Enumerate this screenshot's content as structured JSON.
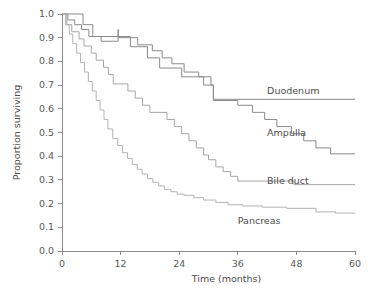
{
  "chart_data": {
    "type": "line",
    "title": "",
    "subtitle": "",
    "xlabel": "Time (months)",
    "ylabel": "Proportion surviving",
    "xlim": [
      0,
      60
    ],
    "ylim": [
      0.0,
      1.0
    ],
    "xticks": [
      0,
      12,
      24,
      36,
      48,
      60
    ],
    "xticklabels": [
      "0",
      "12",
      "24",
      "36",
      "48",
      "60"
    ],
    "yticks": [
      0.0,
      0.1,
      0.2,
      0.3,
      0.4,
      0.5,
      0.6,
      0.7,
      0.8,
      0.9,
      1.0
    ],
    "yticklabels": [
      "0.0",
      "0.1",
      "0.2",
      "0.3",
      "0.4",
      "0.5",
      "0.6",
      "0.7",
      "0.8",
      "0.9",
      "1.0"
    ],
    "grid": false,
    "legend_position": "inline-right-of-curve",
    "plot_style": "kaplan-meier step curves",
    "series": [
      {
        "name": "Duodenum",
        "color": "#8a8a8a",
        "label_x": 42.0,
        "label_y": 0.675,
        "final_value": 0.64,
        "points": [
          [
            0,
            1.0
          ],
          [
            4.3,
            1.0
          ],
          [
            4.3,
            0.955
          ],
          [
            6.3,
            0.955
          ],
          [
            6.3,
            0.905
          ],
          [
            14.0,
            0.905
          ],
          [
            14.0,
            0.862
          ],
          [
            17.5,
            0.862
          ],
          [
            17.5,
            0.815
          ],
          [
            20.0,
            0.815
          ],
          [
            20.0,
            0.772
          ],
          [
            24.5,
            0.772
          ],
          [
            24.5,
            0.735
          ],
          [
            29.0,
            0.735
          ],
          [
            29.0,
            0.7
          ],
          [
            31.0,
            0.7
          ],
          [
            31.0,
            0.64
          ],
          [
            60,
            0.64
          ]
        ]
      },
      {
        "name": "Ampulla",
        "color": "#8a8a8a",
        "label_x": 42.0,
        "label_y": 0.495,
        "final_value": 0.41,
        "points": [
          [
            0,
            1.0
          ],
          [
            1.2,
            1.0
          ],
          [
            1.2,
            0.975
          ],
          [
            2.6,
            0.975
          ],
          [
            2.6,
            0.955
          ],
          [
            4.0,
            0.955
          ],
          [
            4.0,
            0.935
          ],
          [
            5.5,
            0.935
          ],
          [
            5.5,
            0.905
          ],
          [
            8.0,
            0.905
          ],
          [
            8.0,
            0.885
          ],
          [
            11.5,
            0.885
          ],
          [
            11.5,
            0.935
          ],
          [
            11.5,
            0.9
          ],
          [
            15.5,
            0.9
          ],
          [
            15.5,
            0.87
          ],
          [
            18.5,
            0.87
          ],
          [
            18.5,
            0.845
          ],
          [
            20.5,
            0.845
          ],
          [
            20.5,
            0.815
          ],
          [
            22.5,
            0.815
          ],
          [
            22.5,
            0.79
          ],
          [
            25.0,
            0.79
          ],
          [
            25.0,
            0.755
          ],
          [
            28.0,
            0.755
          ],
          [
            28.0,
            0.735
          ],
          [
            30.5,
            0.735
          ],
          [
            30.5,
            0.7
          ],
          [
            31.0,
            0.7
          ],
          [
            31.0,
            0.635
          ],
          [
            36.0,
            0.635
          ],
          [
            36.0,
            0.615
          ],
          [
            39.0,
            0.615
          ],
          [
            39.0,
            0.585
          ],
          [
            41.5,
            0.585
          ],
          [
            41.5,
            0.555
          ],
          [
            44.0,
            0.555
          ],
          [
            44.0,
            0.525
          ],
          [
            47.0,
            0.525
          ],
          [
            47.0,
            0.495
          ],
          [
            49.5,
            0.495
          ],
          [
            49.5,
            0.465
          ],
          [
            52.0,
            0.465
          ],
          [
            52.0,
            0.435
          ],
          [
            55.0,
            0.435
          ],
          [
            55.0,
            0.41
          ],
          [
            60,
            0.41
          ]
        ]
      },
      {
        "name": "Bile duct",
        "color": "#a6a6a6",
        "label_x": 42.0,
        "label_y": 0.295,
        "final_value": 0.28,
        "points": [
          [
            0,
            1.0
          ],
          [
            1.0,
            1.0
          ],
          [
            1.0,
            0.955
          ],
          [
            2.0,
            0.955
          ],
          [
            2.0,
            0.925
          ],
          [
            3.5,
            0.925
          ],
          [
            3.5,
            0.895
          ],
          [
            4.5,
            0.895
          ],
          [
            4.5,
            0.865
          ],
          [
            6.0,
            0.865
          ],
          [
            6.0,
            0.835
          ],
          [
            7.0,
            0.835
          ],
          [
            7.0,
            0.805
          ],
          [
            8.5,
            0.805
          ],
          [
            8.5,
            0.775
          ],
          [
            9.5,
            0.775
          ],
          [
            9.5,
            0.745
          ],
          [
            10.5,
            0.745
          ],
          [
            10.5,
            0.705
          ],
          [
            13.5,
            0.705
          ],
          [
            13.5,
            0.675
          ],
          [
            15.0,
            0.675
          ],
          [
            15.0,
            0.645
          ],
          [
            16.5,
            0.645
          ],
          [
            16.5,
            0.615
          ],
          [
            18.0,
            0.615
          ],
          [
            18.0,
            0.585
          ],
          [
            21.5,
            0.585
          ],
          [
            21.5,
            0.555
          ],
          [
            23.0,
            0.555
          ],
          [
            23.0,
            0.525
          ],
          [
            24.5,
            0.525
          ],
          [
            24.5,
            0.495
          ],
          [
            26.0,
            0.495
          ],
          [
            26.0,
            0.465
          ],
          [
            27.5,
            0.465
          ],
          [
            27.5,
            0.435
          ],
          [
            29.0,
            0.435
          ],
          [
            29.0,
            0.405
          ],
          [
            30.0,
            0.405
          ],
          [
            30.0,
            0.385
          ],
          [
            31.5,
            0.385
          ],
          [
            31.5,
            0.355
          ],
          [
            33.0,
            0.355
          ],
          [
            33.0,
            0.335
          ],
          [
            34.5,
            0.335
          ],
          [
            34.5,
            0.315
          ],
          [
            36.0,
            0.315
          ],
          [
            36.0,
            0.295
          ],
          [
            47.5,
            0.295
          ],
          [
            47.5,
            0.28
          ],
          [
            60,
            0.28
          ]
        ]
      },
      {
        "name": "Pancreas",
        "color": "#b3b3b3",
        "label_x": 36.0,
        "label_y": 0.125,
        "final_value": 0.16,
        "points": [
          [
            0,
            1.0
          ],
          [
            0.7,
            1.0
          ],
          [
            0.7,
            0.955
          ],
          [
            1.5,
            0.955
          ],
          [
            1.5,
            0.915
          ],
          [
            2.2,
            0.915
          ],
          [
            2.2,
            0.875
          ],
          [
            3.0,
            0.875
          ],
          [
            3.0,
            0.835
          ],
          [
            3.8,
            0.835
          ],
          [
            3.8,
            0.795
          ],
          [
            4.6,
            0.795
          ],
          [
            4.6,
            0.755
          ],
          [
            5.4,
            0.755
          ],
          [
            5.4,
            0.715
          ],
          [
            6.2,
            0.715
          ],
          [
            6.2,
            0.675
          ],
          [
            7.0,
            0.675
          ],
          [
            7.0,
            0.635
          ],
          [
            7.8,
            0.635
          ],
          [
            7.8,
            0.595
          ],
          [
            8.6,
            0.595
          ],
          [
            8.6,
            0.555
          ],
          [
            9.4,
            0.555
          ],
          [
            9.4,
            0.515
          ],
          [
            10.4,
            0.515
          ],
          [
            10.4,
            0.475
          ],
          [
            11.4,
            0.475
          ],
          [
            11.4,
            0.445
          ],
          [
            12.4,
            0.445
          ],
          [
            12.4,
            0.415
          ],
          [
            13.4,
            0.415
          ],
          [
            13.4,
            0.39
          ],
          [
            14.4,
            0.39
          ],
          [
            14.4,
            0.365
          ],
          [
            15.4,
            0.365
          ],
          [
            15.4,
            0.345
          ],
          [
            16.4,
            0.345
          ],
          [
            16.4,
            0.325
          ],
          [
            17.5,
            0.325
          ],
          [
            17.5,
            0.305
          ],
          [
            18.6,
            0.305
          ],
          [
            18.6,
            0.29
          ],
          [
            19.8,
            0.29
          ],
          [
            19.8,
            0.275
          ],
          [
            21.0,
            0.275
          ],
          [
            21.0,
            0.26
          ],
          [
            22.3,
            0.26
          ],
          [
            22.3,
            0.25
          ],
          [
            23.6,
            0.25
          ],
          [
            23.6,
            0.24
          ],
          [
            25.0,
            0.24
          ],
          [
            25.0,
            0.235
          ],
          [
            27.0,
            0.235
          ],
          [
            27.0,
            0.225
          ],
          [
            29.0,
            0.225
          ],
          [
            29.0,
            0.215
          ],
          [
            31.5,
            0.215
          ],
          [
            31.5,
            0.205
          ],
          [
            34.0,
            0.205
          ],
          [
            34.0,
            0.195
          ],
          [
            37.0,
            0.195
          ],
          [
            37.0,
            0.19
          ],
          [
            41.0,
            0.19
          ],
          [
            41.0,
            0.185
          ],
          [
            46.0,
            0.185
          ],
          [
            46.0,
            0.18
          ],
          [
            52.0,
            0.18
          ],
          [
            52.0,
            0.165
          ],
          [
            56.0,
            0.165
          ],
          [
            56.0,
            0.16
          ],
          [
            60,
            0.16
          ]
        ]
      }
    ]
  }
}
